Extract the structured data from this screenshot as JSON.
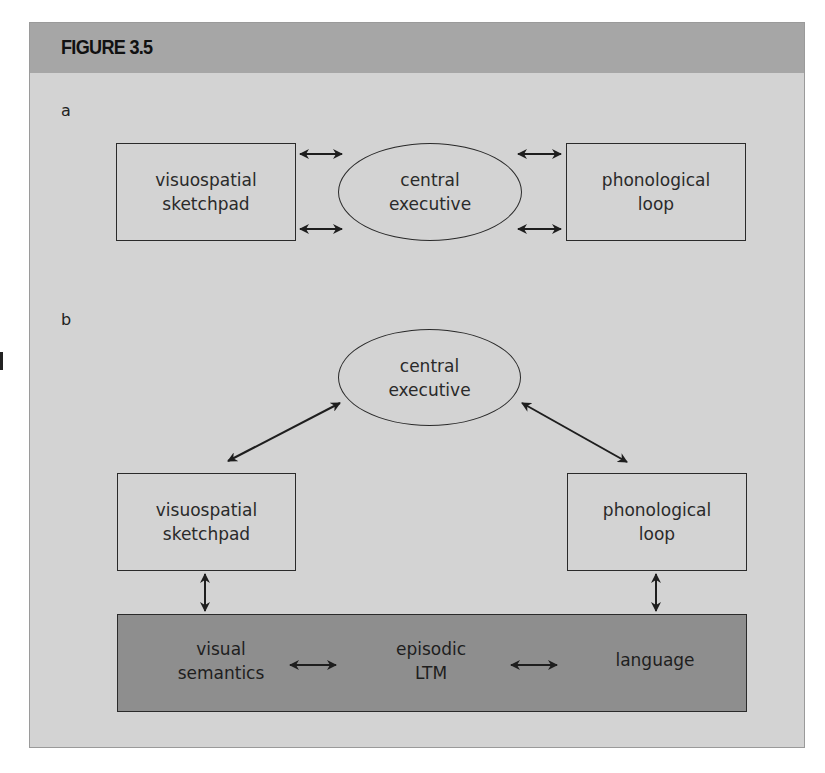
{
  "figure": {
    "title": "FIGURE 3.5",
    "colors": {
      "header": "#a6a6a6",
      "body": "#d3d3d3",
      "ltm_bar": "#8e8e8e",
      "stroke": "#2a2a2a"
    }
  },
  "panel_a": {
    "label": "a",
    "left_box": {
      "line1": "visuospatial",
      "line2": "sketchpad"
    },
    "center_ellipse": {
      "line1": "central",
      "line2": "executive"
    },
    "right_box": {
      "line1": "phonological",
      "line2": "loop"
    },
    "connections": [
      {
        "from": "visuospatial sketchpad",
        "to": "central executive",
        "type": "bidirectional",
        "count": 2
      },
      {
        "from": "central executive",
        "to": "phonological loop",
        "type": "bidirectional",
        "count": 2
      }
    ]
  },
  "panel_b": {
    "label": "b",
    "top_ellipse": {
      "line1": "central",
      "line2": "executive"
    },
    "left_box": {
      "line1": "visuospatial",
      "line2": "sketchpad"
    },
    "right_box": {
      "line1": "phonological",
      "line2": "loop"
    },
    "ltm_bar": {
      "items": [
        {
          "line1": "visual",
          "line2": "semantics"
        },
        {
          "line1": "episodic",
          "line2": "LTM"
        },
        {
          "line1": "language",
          "line2": ""
        }
      ]
    },
    "connections": [
      {
        "from": "central executive",
        "to": "visuospatial sketchpad",
        "type": "bidirectional"
      },
      {
        "from": "central executive",
        "to": "phonological loop",
        "type": "bidirectional"
      },
      {
        "from": "visuospatial sketchpad",
        "to": "visual semantics",
        "type": "bidirectional"
      },
      {
        "from": "phonological loop",
        "to": "language",
        "type": "bidirectional"
      },
      {
        "from": "visual semantics",
        "to": "episodic LTM",
        "type": "bidirectional"
      },
      {
        "from": "episodic LTM",
        "to": "language",
        "type": "bidirectional"
      }
    ]
  }
}
